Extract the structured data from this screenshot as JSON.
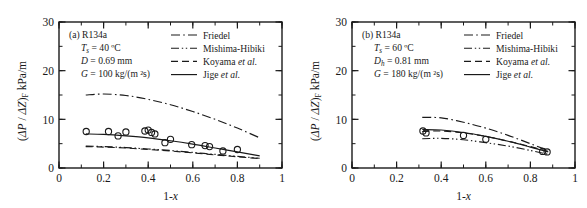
{
  "figure": {
    "panel_count": 2,
    "background_color": "#ffffff",
    "line_color": "#1a1a1a"
  },
  "chart_data": [
    {
      "type": "line",
      "panel_label": "(a)",
      "title": "(a) R134a",
      "xlabel": "1-x",
      "ylabel": "(ΔP / ΔZ)F  kPa/m",
      "ylabel_parts": {
        "prefix": "(ΔP / ΔZ)",
        "subscript": "F",
        "units": "kPa/m"
      },
      "xlim": [
        0,
        1
      ],
      "ylim": [
        0,
        30
      ],
      "xticks": [
        0,
        0.2,
        0.4,
        0.6,
        0.8,
        1
      ],
      "xticklabels": [
        "0",
        "0.2",
        "0.4",
        "0.6",
        "0.8",
        "1"
      ],
      "yticks": [
        0,
        10,
        20,
        30
      ],
      "yticklabels": [
        "0",
        "10",
        "20",
        "30"
      ],
      "x_minor_step": 0.1,
      "y_minor_step": 5,
      "grid": false,
      "legend_position": "top-right",
      "annotations": [
        {
          "name": "refrigerant",
          "text": "(a) R134a",
          "indent": false
        },
        {
          "name": "saturation-temperature",
          "prefix_italic": "T",
          "subscript": "s",
          "text": " = 40 ºC",
          "indent": true
        },
        {
          "name": "diameter",
          "prefix_italic": "D",
          "subscript": "",
          "text": " = 0.69 mm",
          "indent": true
        },
        {
          "name": "mass-flux",
          "prefix_italic": "G",
          "subscript": "",
          "text": " = 100 kg/(m ²s)",
          "indent": true
        }
      ],
      "series": [
        {
          "name": "Friedel",
          "style": "dashdot",
          "x": [
            0.12,
            0.2,
            0.3,
            0.4,
            0.5,
            0.6,
            0.7,
            0.8,
            0.9
          ],
          "values": [
            15.0,
            15.2,
            14.9,
            14.1,
            13.0,
            11.6,
            10.0,
            8.2,
            6.2
          ]
        },
        {
          "name": "Mishima-Hibiki",
          "style": "dashdotdot",
          "x": [
            0.12,
            0.2,
            0.3,
            0.4,
            0.5,
            0.6,
            0.7,
            0.8,
            0.9
          ],
          "values": [
            4.5,
            4.4,
            4.2,
            3.9,
            3.6,
            3.2,
            2.8,
            2.4,
            2.0
          ]
        },
        {
          "name": "Koyama et al.",
          "style": "dashed",
          "x": [
            0.12,
            0.2,
            0.3,
            0.4,
            0.5,
            0.6,
            0.7,
            0.8,
            0.9
          ],
          "values": [
            4.4,
            4.3,
            4.1,
            3.8,
            3.5,
            3.1,
            2.7,
            2.3,
            1.95
          ]
        },
        {
          "name": "Jige et al.",
          "style": "solid",
          "x": [
            0.12,
            0.2,
            0.3,
            0.4,
            0.5,
            0.6,
            0.7,
            0.8,
            0.9
          ],
          "values": [
            7.0,
            6.9,
            6.6,
            6.2,
            5.6,
            4.9,
            4.1,
            3.3,
            2.5
          ]
        }
      ],
      "scatter": {
        "name": "experimental-data",
        "marker": "open-circle",
        "points": [
          {
            "x": 0.122,
            "y": 7.5
          },
          {
            "x": 0.222,
            "y": 7.5
          },
          {
            "x": 0.265,
            "y": 6.6
          },
          {
            "x": 0.3,
            "y": 7.4
          },
          {
            "x": 0.385,
            "y": 7.6
          },
          {
            "x": 0.4,
            "y": 7.8
          },
          {
            "x": 0.415,
            "y": 7.3
          },
          {
            "x": 0.43,
            "y": 7.0
          },
          {
            "x": 0.475,
            "y": 5.2
          },
          {
            "x": 0.5,
            "y": 5.9
          },
          {
            "x": 0.595,
            "y": 4.8
          },
          {
            "x": 0.655,
            "y": 4.6
          },
          {
            "x": 0.675,
            "y": 4.4
          },
          {
            "x": 0.735,
            "y": 3.5
          },
          {
            "x": 0.8,
            "y": 3.8
          }
        ]
      }
    },
    {
      "type": "line",
      "panel_label": "(b)",
      "title": "(b) R134a",
      "xlabel": "1-x",
      "ylabel": "(ΔP / ΔZ)F  kPa/m",
      "ylabel_parts": {
        "prefix": "(ΔP / ΔZ)",
        "subscript": "F",
        "units": "kPa/m"
      },
      "xlim": [
        0,
        1
      ],
      "ylim": [
        0,
        30
      ],
      "xticks": [
        0,
        0.2,
        0.4,
        0.6,
        0.8,
        1
      ],
      "xticklabels": [
        "0",
        "0.2",
        "0.4",
        "0.6",
        "0.8",
        "1"
      ],
      "yticks": [
        0,
        10,
        20,
        30
      ],
      "yticklabels": [
        "0",
        "10",
        "20",
        "30"
      ],
      "x_minor_step": 0.1,
      "y_minor_step": 5,
      "grid": false,
      "legend_position": "top-right",
      "annotations": [
        {
          "name": "refrigerant",
          "text": "(b) R134a",
          "indent": false
        },
        {
          "name": "saturation-temperature",
          "prefix_italic": "T",
          "subscript": "s",
          "text": " = 60 ºC",
          "indent": true
        },
        {
          "name": "hydraulic-diameter",
          "prefix_italic": "D",
          "subscript": "h",
          "text": " = 0.81 mm",
          "indent": true
        },
        {
          "name": "mass-flux",
          "prefix_italic": "G",
          "subscript": "",
          "text": " = 180 kg/(m ²s)",
          "indent": true
        }
      ],
      "series": [
        {
          "name": "Friedel",
          "style": "dashdot",
          "x": [
            0.315,
            0.4,
            0.5,
            0.6,
            0.7,
            0.8,
            0.88
          ],
          "values": [
            10.4,
            10.3,
            9.4,
            8.2,
            6.7,
            5.0,
            3.6
          ]
        },
        {
          "name": "Mishima-Hibiki",
          "style": "dashdotdot",
          "x": [
            0.315,
            0.4,
            0.5,
            0.6,
            0.7,
            0.8,
            0.88
          ],
          "values": [
            6.0,
            6.1,
            5.8,
            5.2,
            4.5,
            3.6,
            2.8
          ]
        },
        {
          "name": "Koyama et al.",
          "style": "dashed",
          "x": [
            0.315,
            0.4,
            0.5,
            0.6,
            0.7,
            0.8,
            0.88
          ],
          "values": [
            7.5,
            7.6,
            7.2,
            6.5,
            5.5,
            4.4,
            3.4
          ]
        },
        {
          "name": "Jige et al.",
          "style": "solid",
          "x": [
            0.315,
            0.4,
            0.5,
            0.6,
            0.7,
            0.8,
            0.88
          ],
          "values": [
            7.9,
            7.8,
            7.3,
            6.5,
            5.5,
            4.3,
            3.3
          ]
        }
      ],
      "scatter": {
        "name": "experimental-data",
        "marker": "open-circle",
        "points": [
          {
            "x": 0.318,
            "y": 7.6
          },
          {
            "x": 0.332,
            "y": 7.2
          },
          {
            "x": 0.5,
            "y": 6.7
          },
          {
            "x": 0.6,
            "y": 5.9
          },
          {
            "x": 0.855,
            "y": 3.4
          },
          {
            "x": 0.875,
            "y": 3.3
          }
        ]
      }
    }
  ],
  "legend": {
    "entries": [
      {
        "label": "Friedel",
        "style": "dashdot",
        "italic_suffix": ""
      },
      {
        "label": "Mishima-Hibiki",
        "style": "dashdotdot",
        "italic_suffix": ""
      },
      {
        "label": "Koyama",
        "style": "dashed",
        "italic_suffix": "et al."
      },
      {
        "label": "Jige",
        "style": "solid",
        "italic_suffix": "et al."
      }
    ]
  }
}
